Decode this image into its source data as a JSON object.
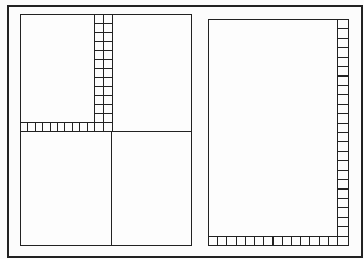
{
  "diagram": {
    "title": "",
    "colors": {
      "line": "#222222",
      "background": "#fcfcfc"
    },
    "left_panel": {
      "label": "",
      "quadrants": 4,
      "vertical_strip": {
        "columns": 2,
        "rows": 13
      },
      "horizontal_strip": {
        "cells": 10
      }
    },
    "right_panel": {
      "label": "",
      "right_strip": {
        "cells": 24
      },
      "bottom_strip": {
        "cells": 15
      }
    }
  }
}
